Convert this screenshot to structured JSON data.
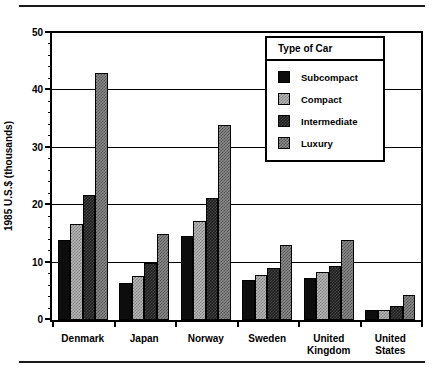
{
  "chart_data": {
    "type": "bar",
    "title": "",
    "subtitle": "",
    "xlabel": "",
    "ylabel": "1985 U.S.$ (thousands)",
    "ylim": [
      0,
      50
    ],
    "y_major_ticks": [
      0,
      10,
      20,
      30,
      40,
      50
    ],
    "y_minor_tick_step": 2,
    "grid": "horizontal-major",
    "legend_position": "upper-right-inside",
    "legend_title": "Type of Car",
    "categories": [
      "Denmark",
      "Japan",
      "Norway",
      "Sweden",
      "United Kingdom",
      "United States"
    ],
    "series": [
      {
        "name": "Subcompact",
        "pattern": "solid-black",
        "color": "#0d0d0d",
        "values": [
          14.0,
          6.5,
          14.7,
          6.9,
          7.4,
          1.7
        ]
      },
      {
        "name": "Compact",
        "pattern": "light-checker",
        "color": "#b9b9b9",
        "values": [
          16.8,
          7.7,
          17.2,
          7.8,
          8.3,
          1.8
        ]
      },
      {
        "name": "Intermediate",
        "pattern": "dark-checker",
        "color": "#1c1c1c",
        "values": [
          21.8,
          10.0,
          21.2,
          9.1,
          9.4,
          2.5
        ]
      },
      {
        "name": "Luxury",
        "pattern": "mid-gray-checker",
        "color": "#8e8e8e",
        "values": [
          43.0,
          15.0,
          34.0,
          13.0,
          14.0,
          4.3
        ]
      }
    ]
  },
  "axis": {
    "y_tick_labels": [
      "0",
      "10",
      "20",
      "30",
      "40",
      "50"
    ],
    "y_title": "1985 U.S.$ (thousands)"
  },
  "legend": {
    "title": "Type of Car",
    "items": [
      {
        "label": "Subcompact"
      },
      {
        "label": "Compact"
      },
      {
        "label": "Intermediate"
      },
      {
        "label": "Luxury"
      }
    ]
  },
  "x_labels": [
    "Denmark",
    "Japan",
    "Norway",
    "Sweden",
    "United\nKingdom",
    "United\nStates"
  ]
}
